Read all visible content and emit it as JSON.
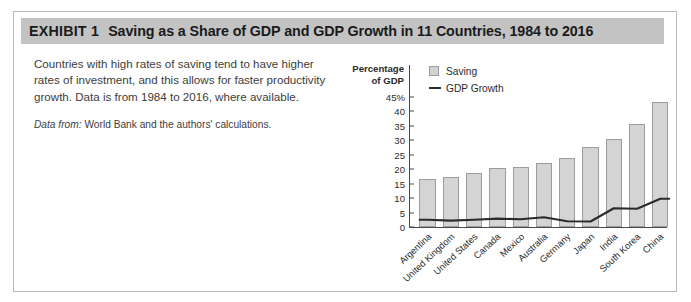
{
  "exhibit": {
    "label": "EXHIBIT 1",
    "title": "Saving as a Share of GDP and GDP Growth in 11 Countries, 1984 to 2016",
    "header_bg": "#c3c3c3"
  },
  "description": {
    "body": "Countries with high rates of saving tend to have higher rates of investment, and this allows for faster productivity growth. Data is from 1984 to 2016, where available.",
    "source_label": "Data from:",
    "source_text": "World Bank and the authors' calculations."
  },
  "chart_data": {
    "type": "bar",
    "title": "",
    "subtitle": "",
    "ylabel": "Percentage of GDP",
    "ylabel_line1": "Percentage",
    "ylabel_line2": "of GDP",
    "xlabel": "",
    "ylim": [
      0,
      45
    ],
    "yticks": [
      0,
      5,
      10,
      15,
      20,
      25,
      30,
      35,
      40,
      45
    ],
    "ytick_labels": [
      "0",
      "5",
      "10",
      "15",
      "20",
      "25",
      "30",
      "35",
      "40",
      "45%"
    ],
    "grid": false,
    "legend_position": "top-left",
    "categories": [
      "Argentina",
      "United Kingdom",
      "United States",
      "Canada",
      "Mexico",
      "Australia",
      "Germany",
      "Japan",
      "India",
      "South Korea",
      "China"
    ],
    "series": [
      {
        "name": "Saving",
        "type": "bar",
        "color": "#d4d4d4",
        "edge_color": "#9c9c9c",
        "values": [
          16.5,
          17.3,
          18.7,
          20.4,
          20.8,
          22.2,
          24.0,
          27.8,
          30.3,
          35.7,
          43.2
        ]
      },
      {
        "name": "GDP Growth",
        "type": "line",
        "color": "#2b2b2b",
        "values": [
          2.5,
          2.2,
          2.5,
          2.9,
          2.7,
          3.4,
          2.0,
          1.9,
          6.5,
          6.3,
          9.8
        ]
      }
    ]
  }
}
